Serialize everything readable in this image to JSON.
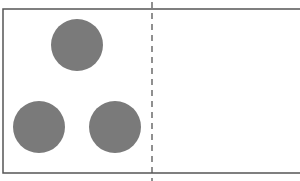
{
  "canvas": {
    "width": 300,
    "height": 181,
    "background": "#ffffff"
  },
  "frame": {
    "left": 3,
    "top": 9,
    "bottom": 173,
    "right": 300,
    "stroke": "#555555",
    "stroke_width": 1.5,
    "right_side_open": true
  },
  "divider": {
    "x": 152,
    "y1": 2,
    "y2": 181,
    "stroke": "#555555",
    "stroke_width": 1.3,
    "dash": "6,5"
  },
  "circles": [
    {
      "id": "top",
      "cx": 77,
      "cy": 45,
      "r": 26,
      "fill": "#7a7a7a"
    },
    {
      "id": "bottom-left",
      "cx": 39,
      "cy": 127,
      "r": 26,
      "fill": "#7a7a7a"
    },
    {
      "id": "bottom-right",
      "cx": 115,
      "cy": 127,
      "r": 26,
      "fill": "#7a7a7a"
    }
  ]
}
